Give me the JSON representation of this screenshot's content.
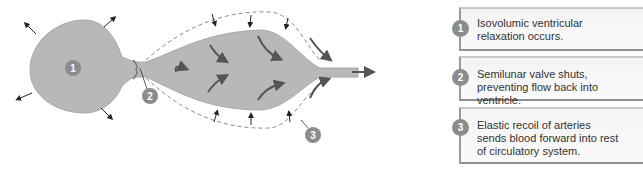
{
  "diagram": {
    "colors": {
      "chamber": "#b8b8b8",
      "badge": "#8c8c8c",
      "arrow": "#5a5a5a",
      "dashed": "#8a8a8a"
    },
    "markers": [
      {
        "number": "1",
        "label": "ventricle"
      },
      {
        "number": "2",
        "label": "semilunar-valve"
      },
      {
        "number": "3",
        "label": "elastic-artery"
      }
    ]
  },
  "steps": [
    {
      "number": "1",
      "text": "Isovolumic ventricular relaxation occurs."
    },
    {
      "number": "2",
      "text": "Semilunar valve shuts, preventing flow back into ventricle."
    },
    {
      "number": "3",
      "text": "Elastic recoil of arteries sends blood forward into rest of circulatory system."
    }
  ]
}
